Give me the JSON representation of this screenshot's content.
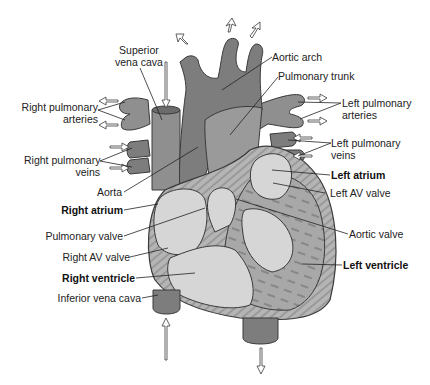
{
  "diagram": {
    "colors": {
      "background": "#ffffff",
      "vessel_dark": "#7d7d7d",
      "vessel_mid": "#8f8f8f",
      "chamber_light": "#d6d6d6",
      "muscle": "#a8a8a8",
      "outline": "#3a3a3a",
      "arrow_fill": "#ffffff"
    },
    "labels": {
      "superior_vena_cava": [
        "Superior",
        "vena cava"
      ],
      "aortic_arch": "Aortic arch",
      "pulmonary_trunk": "Pulmonary trunk",
      "right_pulmonary_arteries": [
        "Right pulmonary",
        "arteries"
      ],
      "left_pulmonary_arteries": [
        "Left pulmonary",
        "arteries"
      ],
      "right_pulmonary_veins": [
        "Right pulmonary",
        "veins"
      ],
      "left_pulmonary_veins": [
        "Left pulmonary",
        "veins"
      ],
      "aorta": "Aorta",
      "left_atrium": "Left atrium",
      "left_av_valve": "Left AV valve",
      "right_atrium": "Right atrium",
      "pulmonary_valve": "Pulmonary valve",
      "aortic_valve": "Aortic valve",
      "right_av_valve": "Right AV valve",
      "right_ventricle": "Right ventricle",
      "left_ventricle": "Left ventricle",
      "inferior_vena_cava": "Inferior vena cava"
    }
  }
}
